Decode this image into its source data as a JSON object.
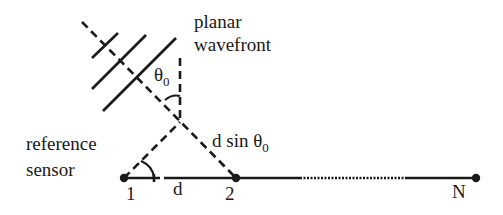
{
  "diagram": {
    "labels": {
      "wavefront_line1": "planar",
      "wavefront_line2": "wavefront",
      "angle_symbol": "θ",
      "angle_subscript": "0",
      "path_diff_prefix": "d sin θ",
      "path_diff_subscript": "0",
      "reference_line1": "reference",
      "reference_line2": "sensor",
      "spacing": "d",
      "sensor_1": "1",
      "sensor_2": "2",
      "sensor_N": "N"
    },
    "colors": {
      "ink": "#1a1a1a",
      "background": "#ffffff"
    },
    "sensors": [
      {
        "id": "1",
        "x": 124,
        "y": 178
      },
      {
        "id": "2",
        "x": 236,
        "y": 178
      },
      {
        "id": "N",
        "x": 476,
        "y": 178
      }
    ]
  }
}
